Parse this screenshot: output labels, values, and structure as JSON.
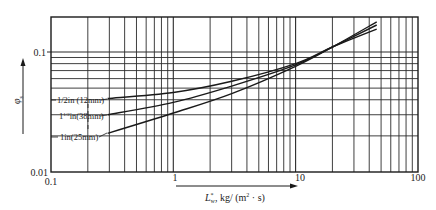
{
  "chart_data": {
    "type": "line",
    "title": "",
    "xlabel": "L*w, kg/(m²·s)",
    "ylabel": "φs",
    "xscale": "log",
    "yscale": "log",
    "xlim": [
      0.1,
      100
    ],
    "ylim": [
      0.01,
      0.2
    ],
    "x_tick_labels": [
      "0.1",
      "1",
      "10",
      "100"
    ],
    "y_tick_labels": [
      "0.01",
      "0.1"
    ],
    "grid": true,
    "legend_position": "inline labels at left end of curves",
    "series": [
      {
        "name": "1/2in (12mm)",
        "x": [
          0.29,
          1,
          3,
          10,
          20,
          46
        ],
        "y": [
          0.041,
          0.046,
          0.057,
          0.08,
          0.11,
          0.155
        ]
      },
      {
        "name": "1½in(38mm)",
        "x": [
          0.29,
          1,
          3,
          10,
          20,
          46
        ],
        "y": [
          0.03,
          0.038,
          0.052,
          0.078,
          0.11,
          0.168
        ]
      },
      {
        "name": "1in(25mm)",
        "x": [
          0.29,
          1,
          3,
          10,
          20,
          46
        ],
        "y": [
          0.021,
          0.031,
          0.045,
          0.076,
          0.11,
          0.178
        ]
      }
    ]
  },
  "axes": {
    "x_title_main": "L",
    "x_title_sup": "*",
    "x_title_sub": "w",
    "x_title_rest": ",  kg/ (m",
    "x_title_sq": "2",
    "x_title_end": " · s)",
    "y_title_main": "φ",
    "y_title_sub": "s"
  },
  "labels": {
    "half_inch": "1/2in (12mm)",
    "one_half_pre": "1",
    "one_half_frac": "1/2",
    "one_half_post": "in(38mm)",
    "one_inch": "1in(25mm)"
  },
  "ticks": {
    "x0": "0.1",
    "x1": "1",
    "x2": "10",
    "x3": "100",
    "y0": "0.01",
    "y1": "0.1"
  },
  "colors": {
    "line": "#1a1a1a",
    "grid": "#2a2a2a",
    "background": "#ffffff"
  }
}
